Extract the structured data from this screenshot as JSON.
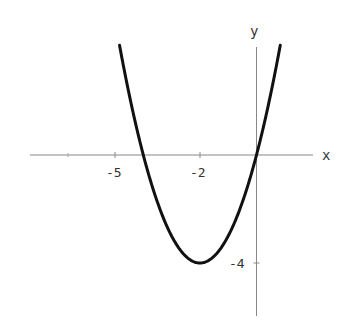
{
  "chart_data": {
    "type": "line",
    "title": "",
    "xlabel": "x",
    "ylabel": "y",
    "function": "y = x^2 + 4x",
    "xlim": [
      -8,
      2
    ],
    "ylim": [
      -6,
      4
    ],
    "x_ticks": [
      {
        "value": -5,
        "label": "-5"
      },
      {
        "value": -2,
        "label": "-2"
      }
    ],
    "y_ticks": [
      {
        "value": -4,
        "label": "-4"
      }
    ],
    "grid": false,
    "legend": null,
    "series": [
      {
        "name": "parabola",
        "color": "#111111",
        "x": [
          -4.85,
          -4.5,
          -4,
          -3.5,
          -3,
          -2.5,
          -2,
          -1.5,
          -1,
          -0.5,
          0,
          0.5,
          0.85
        ],
        "y": [
          4.12,
          2.25,
          0,
          -1.75,
          -3,
          -3.75,
          -4,
          -3.75,
          -3,
          -1.75,
          0,
          2.25,
          4.12
        ]
      }
    ],
    "annotations": {
      "vertex": [
        -2,
        -4
      ],
      "roots": [
        -4,
        0
      ]
    }
  },
  "labels": {
    "x_axis": "x",
    "y_axis": "y",
    "tick_x_minus5": "-5",
    "tick_x_minus2": "-2",
    "tick_y_minus4": "-4"
  }
}
